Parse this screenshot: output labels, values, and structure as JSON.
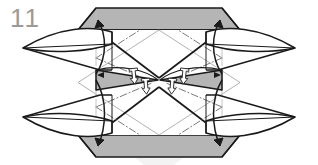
{
  "figure": {
    "domain_kind": "origami-folding-diagram",
    "step_number": "11",
    "caption": "",
    "canvas": {
      "width": 318,
      "height": 165
    },
    "palette": {
      "paper_front": "#ffffff",
      "paper_back_gray": "#b5b5b5",
      "paper_back_gray_dark": "#a3a3a3",
      "ink": "#1a1a1a",
      "ink_thin": "#4a4a4a",
      "crease_light": "#9e9e9e",
      "step_number_color": "#9a9a9a",
      "watermark": "#f2f2f2",
      "background": "#ffffff"
    },
    "geometry": {
      "center_x": 159,
      "center_y": 82.5,
      "left_tip_x": 23,
      "right_tip_x": 295,
      "upper_wing_tip_y": 48,
      "lower_wing_tip_y": 117,
      "top_band_y": 8,
      "bottom_band_y": 157,
      "band_inner_left_x": 96,
      "band_inner_right_x": 222,
      "band_outer_left_x": 78,
      "band_outer_right_x": 240
    },
    "shapes": [
      {
        "name": "top-gray-band",
        "kind": "trapezoid-gray",
        "fill": "#b5b5b5"
      },
      {
        "name": "bottom-gray-band",
        "kind": "trapezoid-gray",
        "fill": "#b5b5b5"
      },
      {
        "name": "upper-left-wing",
        "kind": "lens-point-white",
        "fill": "#ffffff"
      },
      {
        "name": "upper-right-wing",
        "kind": "lens-point-white",
        "fill": "#ffffff"
      },
      {
        "name": "lower-left-wing",
        "kind": "lens-point-white",
        "fill": "#ffffff"
      },
      {
        "name": "lower-right-wing",
        "kind": "lens-point-white",
        "fill": "#ffffff"
      },
      {
        "name": "center-left-gray-sliver",
        "kind": "tapered-gray",
        "fill": "#b5b5b5"
      },
      {
        "name": "center-right-gray-sliver",
        "kind": "tapered-gray",
        "fill": "#b5b5b5"
      },
      {
        "name": "center-diamond",
        "kind": "diamond-outline",
        "fill": "none"
      }
    ],
    "fold_lines": [
      {
        "name": "mountain-crease-upper-left",
        "style": "dash-dot"
      },
      {
        "name": "mountain-crease-upper-right",
        "style": "dash-dot"
      },
      {
        "name": "mountain-crease-lower-left",
        "style": "dash-dot"
      },
      {
        "name": "mountain-crease-lower-right",
        "style": "dash-dot"
      },
      {
        "name": "vertical-reference-left",
        "style": "thin-solid-light"
      },
      {
        "name": "vertical-reference-right",
        "style": "thin-solid-light"
      },
      {
        "name": "horizontal-midline",
        "style": "thin-solid"
      }
    ],
    "arrows": [
      {
        "name": "fold-arrow-upper-left",
        "kind": "curved-fold-arrow",
        "direction": "up-outward"
      },
      {
        "name": "fold-arrow-upper-right",
        "kind": "curved-fold-arrow",
        "direction": "up-outward"
      },
      {
        "name": "fold-arrow-lower-left",
        "kind": "curved-fold-arrow",
        "direction": "down-outward"
      },
      {
        "name": "fold-arrow-lower-right",
        "kind": "curved-fold-arrow",
        "direction": "down-outward"
      },
      {
        "name": "push-arrow-center-left-a",
        "kind": "hollow-push-arrow",
        "direction": "down"
      },
      {
        "name": "push-arrow-center-left-b",
        "kind": "hollow-push-arrow",
        "direction": "down"
      },
      {
        "name": "push-arrow-center-right-a",
        "kind": "hollow-push-arrow",
        "direction": "down"
      },
      {
        "name": "push-arrow-center-right-b",
        "kind": "hollow-push-arrow",
        "direction": "down"
      },
      {
        "name": "sink-arrow-center-left",
        "kind": "solid-small-arrow",
        "direction": "inward"
      },
      {
        "name": "sink-arrow-center-right",
        "kind": "solid-small-arrow",
        "direction": "inward"
      }
    ]
  }
}
